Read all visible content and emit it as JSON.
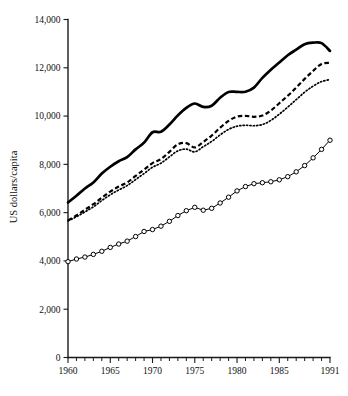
{
  "chart_data": {
    "type": "line",
    "title": "",
    "subtitle": "",
    "xlabel": "",
    "ylabel": "US dollars/capita",
    "xlim": [
      1960,
      1991
    ],
    "ylim": [
      0,
      14000
    ],
    "grid": false,
    "legend_position": "none",
    "x_ticks_major": [
      1960,
      1965,
      1970,
      1975,
      1980,
      1985,
      1991
    ],
    "x_tick_labels": [
      "1960",
      "1965",
      "1970",
      "1975",
      "1980",
      "1985",
      "1991"
    ],
    "x_ticks_minor_step": 1,
    "y_ticks": [
      0,
      2000,
      4000,
      6000,
      8000,
      10000,
      12000,
      14000
    ],
    "y_tick_labels": [
      "0",
      "2,000",
      "4,000",
      "6,000",
      "8,000",
      "10,000",
      "12,000",
      "14,000"
    ],
    "x": [
      1960,
      1961,
      1962,
      1963,
      1964,
      1965,
      1966,
      1967,
      1968,
      1969,
      1970,
      1971,
      1972,
      1973,
      1974,
      1975,
      1976,
      1977,
      1978,
      1979,
      1980,
      1981,
      1982,
      1983,
      1984,
      1985,
      1986,
      1987,
      1988,
      1989,
      1990,
      1991
    ],
    "series": [
      {
        "name": "solid-thick-series",
        "style": "solid",
        "marker": "none",
        "color": "#000000",
        "values": [
          6420,
          6700,
          7000,
          7250,
          7620,
          7900,
          8130,
          8300,
          8620,
          8900,
          9330,
          9350,
          9650,
          10030,
          10340,
          10520,
          10380,
          10430,
          10760,
          11000,
          11000,
          11010,
          11180,
          11580,
          11920,
          12220,
          12520,
          12750,
          12980,
          13040,
          13020,
          12700
        ]
      },
      {
        "name": "dashed-series",
        "style": "dashed",
        "marker": "none",
        "color": "#000000",
        "values": [
          5680,
          5880,
          6120,
          6350,
          6620,
          6870,
          7080,
          7250,
          7520,
          7780,
          8050,
          8220,
          8520,
          8830,
          8880,
          8700,
          8930,
          9190,
          9520,
          9800,
          9980,
          10010,
          9970,
          10020,
          10230,
          10530,
          10840,
          11180,
          11540,
          11870,
          12160,
          12210
        ]
      },
      {
        "name": "dotted-series",
        "style": "dotted",
        "marker": "none",
        "color": "#000000",
        "values": [
          5660,
          5830,
          6030,
          6240,
          6500,
          6740,
          6940,
          7120,
          7370,
          7620,
          7880,
          8050,
          8310,
          8560,
          8630,
          8520,
          8730,
          8950,
          9220,
          9450,
          9580,
          9620,
          9600,
          9650,
          9820,
          10080,
          10370,
          10680,
          10990,
          11240,
          11430,
          11510
        ]
      },
      {
        "name": "open-circle-series",
        "style": "solid-thin",
        "marker": "open-circle",
        "color": "#000000",
        "values": [
          3970,
          4080,
          4160,
          4270,
          4400,
          4560,
          4700,
          4820,
          5010,
          5220,
          5300,
          5440,
          5640,
          5880,
          6080,
          6220,
          6100,
          6180,
          6400,
          6640,
          6900,
          7080,
          7200,
          7240,
          7280,
          7360,
          7490,
          7690,
          7950,
          8270,
          8620,
          9000
        ]
      }
    ]
  }
}
